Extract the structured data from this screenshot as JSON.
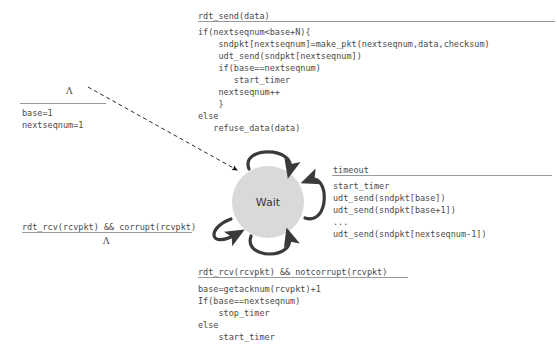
{
  "diagram": {
    "state": {
      "name": "Wait",
      "label": "Wait",
      "fill_color": "#d9d9d9"
    },
    "init": {
      "label": "Λ",
      "actions": "base=1\nnextseqnum=1",
      "action_line_1": "base=1",
      "action_line_2": "nextseqnum=1",
      "arrow_style": "dashed"
    },
    "transitions": [
      {
        "id": "rdt-send",
        "condition": "rdt_send(data)",
        "action": "if(nextseqnum<base+N){\n    sndpkt[nextseqnum]=make_pkt(nextseqnum,data,checksum)\n    udt_send(sndpkt[nextseqnum])\n    if(base==nextseqnum)\n       start_timer\n    nextseqnum++\n    }\nelse\n   refuse_data(data)",
        "position": "top"
      },
      {
        "id": "timeout",
        "condition": "timeout",
        "action": "start_timer\nudt_send(sndpkt[base])\nudt_send(sndpkt[base+1])\n...\nudt_send(sndpkt[nextseqnum-1])",
        "position": "right"
      },
      {
        "id": "rdt-rcv-corrupt",
        "condition": "rdt_rcv(rcvpkt) && corrupt(rcvpkt)",
        "action": "Λ",
        "position": "left"
      },
      {
        "id": "rdt-rcv-notcorrupt",
        "condition": "rdt_rcv(rcvpkt) && notcorrupt(rcvpkt)",
        "action": "base=getacknum(rcvpkt)+1\nIf(base==nextseqnum)\n    stop_timer\nelse\n    start_timer",
        "position": "bottom"
      }
    ],
    "colors": {
      "text": "#4a4a4a",
      "rule": "#9a9a9a",
      "arrow": "#3a3a3a",
      "state_fill": "#d9d9d9",
      "background": "#ffffff"
    }
  }
}
